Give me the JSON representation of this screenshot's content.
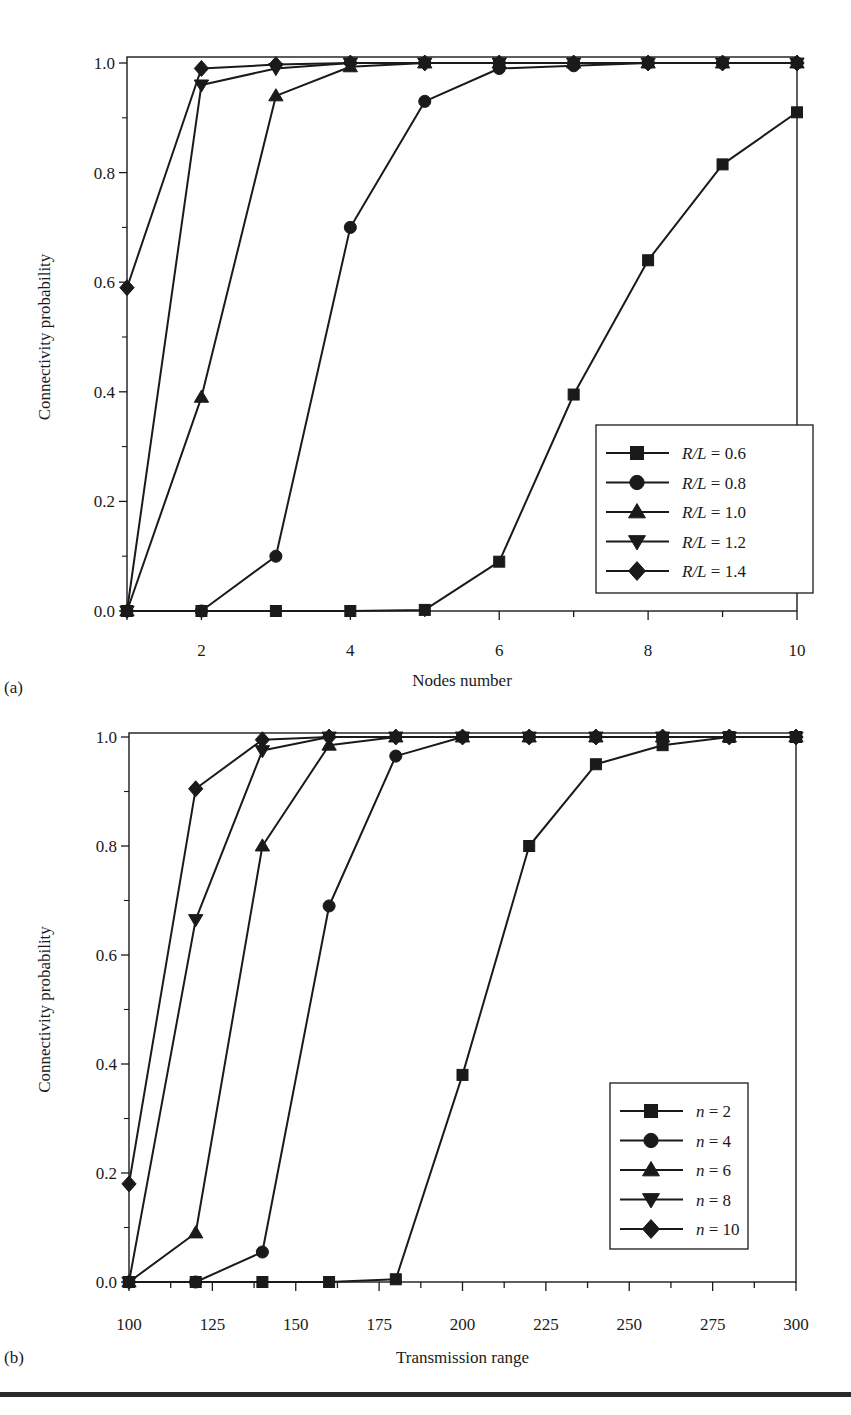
{
  "chart_data": [
    {
      "panel_label": "(a)",
      "type": "line",
      "title": "",
      "xlabel": "Nodes number",
      "ylabel": "Connectivity probability",
      "xlim": [
        1,
        10
      ],
      "ylim": [
        0.0,
        1.0
      ],
      "xticks": [
        2,
        4,
        6,
        8,
        10
      ],
      "xtick_labels": [
        "2",
        "4",
        "6",
        "8",
        "10"
      ],
      "yticks": [
        0.0,
        0.2,
        0.4,
        0.6,
        0.8,
        1.0
      ],
      "ytick_labels": [
        "0.0",
        "0.2",
        "0.4",
        "0.6",
        "0.8",
        "1.0"
      ],
      "grid": false,
      "legend_position": "lower right",
      "x": [
        1,
        2,
        3,
        4,
        5,
        6,
        7,
        8,
        9,
        10
      ],
      "series": [
        {
          "name": "R/L = 0.6",
          "marker": "square",
          "values": [
            0.0,
            0.0,
            0.0,
            0.0,
            0.002,
            0.09,
            0.395,
            0.64,
            0.815,
            0.91
          ]
        },
        {
          "name": "R/L = 0.8",
          "marker": "circle",
          "values": [
            0.0,
            0.0,
            0.1,
            0.7,
            0.93,
            0.99,
            0.995,
            1.0,
            1.0,
            1.0
          ]
        },
        {
          "name": "R/L = 1.0",
          "marker": "triangle-up",
          "values": [
            0.0,
            0.39,
            0.94,
            0.993,
            1.0,
            1.0,
            1.0,
            1.0,
            1.0,
            1.0
          ]
        },
        {
          "name": "R/L = 1.2",
          "marker": "triangle-down",
          "values": [
            0.0,
            0.96,
            0.99,
            1.0,
            1.0,
            1.0,
            1.0,
            1.0,
            1.0,
            1.0
          ]
        },
        {
          "name": "R/L = 1.4",
          "marker": "diamond",
          "values": [
            0.59,
            0.99,
            0.997,
            1.0,
            1.0,
            1.0,
            1.0,
            1.0,
            1.0,
            1.0
          ]
        }
      ],
      "legend": [
        {
          "var": "R/L",
          "eq": " = ",
          "val": "0.6"
        },
        {
          "var": "R/L",
          "eq": " = ",
          "val": "0.8"
        },
        {
          "var": "R/L",
          "eq": " = ",
          "val": "1.0"
        },
        {
          "var": "R/L",
          "eq": " = ",
          "val": "1.2"
        },
        {
          "var": "R/L",
          "eq": " = ",
          "val": "1.4"
        }
      ]
    },
    {
      "panel_label": "(b)",
      "type": "line",
      "title": "",
      "xlabel": "Transmission range",
      "ylabel": "Connectivity probability",
      "xlim": [
        100,
        300
      ],
      "ylim": [
        0.0,
        1.0
      ],
      "xticks": [
        100,
        125,
        150,
        175,
        200,
        225,
        250,
        275,
        300
      ],
      "xtick_labels": [
        "100",
        "125",
        "150",
        "175",
        "200",
        "225",
        "250",
        "275",
        "300"
      ],
      "yticks": [
        0.0,
        0.2,
        0.4,
        0.6,
        0.8,
        1.0
      ],
      "ytick_labels": [
        "0.0",
        "0.2",
        "0.4",
        "0.6",
        "0.8",
        "1.0"
      ],
      "grid": false,
      "legend_position": "lower right",
      "x": [
        100,
        120,
        140,
        160,
        180,
        200,
        220,
        240,
        260,
        280,
        300
      ],
      "series": [
        {
          "name": "n = 2",
          "marker": "square",
          "values": [
            0.0,
            0.0,
            0.0,
            0.0,
            0.005,
            0.38,
            0.8,
            0.95,
            0.985,
            1.0,
            1.0
          ]
        },
        {
          "name": "n = 4",
          "marker": "circle",
          "values": [
            0.0,
            0.0,
            0.055,
            0.69,
            0.965,
            1.0,
            1.0,
            1.0,
            1.0,
            1.0,
            1.0
          ]
        },
        {
          "name": "n = 6",
          "marker": "triangle-up",
          "values": [
            0.0,
            0.09,
            0.8,
            0.985,
            1.0,
            1.0,
            1.0,
            1.0,
            1.0,
            1.0,
            1.0
          ]
        },
        {
          "name": "n = 8",
          "marker": "triangle-down",
          "values": [
            0.0,
            0.665,
            0.975,
            1.0,
            1.0,
            1.0,
            1.0,
            1.0,
            1.0,
            1.0,
            1.0
          ]
        },
        {
          "name": "n = 10",
          "marker": "diamond",
          "values": [
            0.18,
            0.905,
            0.995,
            1.0,
            1.0,
            1.0,
            1.0,
            1.0,
            1.0,
            1.0,
            1.0
          ]
        }
      ],
      "legend": [
        {
          "var": "n",
          "eq": " = ",
          "val": "2"
        },
        {
          "var": "n",
          "eq": " = ",
          "val": "4"
        },
        {
          "var": "n",
          "eq": " = ",
          "val": "6"
        },
        {
          "var": "n",
          "eq": " = ",
          "val": "8"
        },
        {
          "var": "n",
          "eq": " = ",
          "val": "10"
        }
      ]
    }
  ],
  "colors": {
    "ink": "#1a1a1a",
    "background": "#ffffff",
    "rule": "#2a2a2a"
  }
}
